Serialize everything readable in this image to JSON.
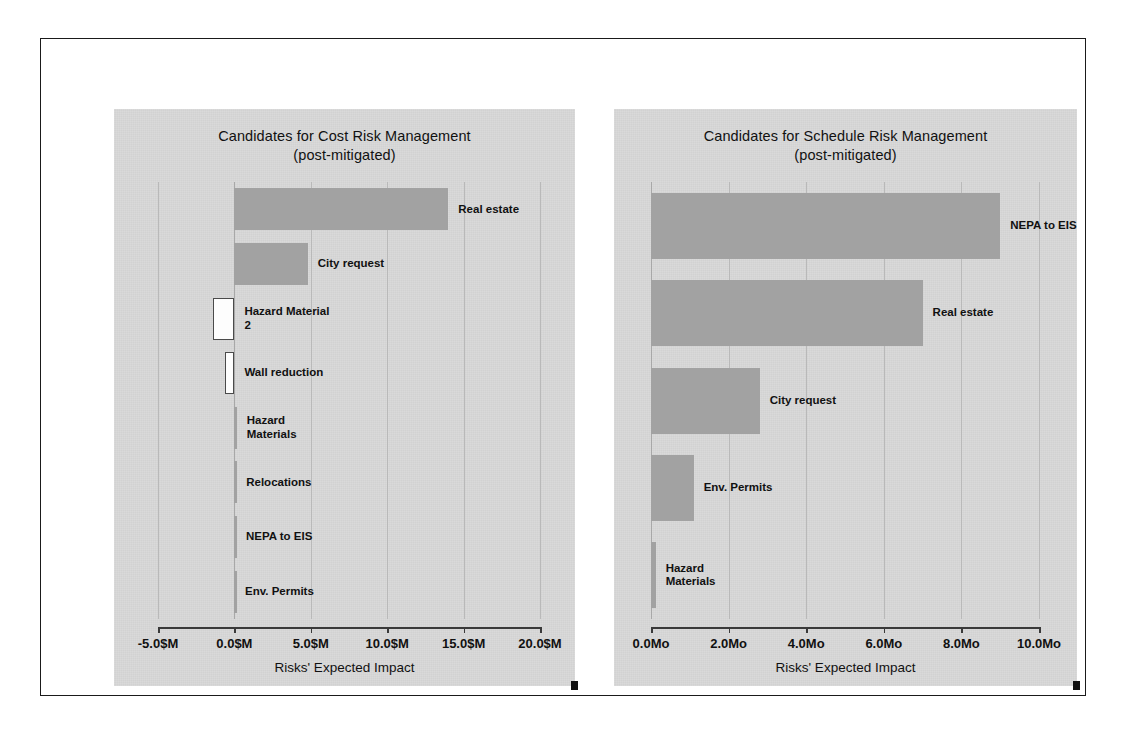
{
  "slide": {
    "border_color": "#1a1a1a",
    "background": "#ffffff"
  },
  "charts": [
    {
      "id": "cost",
      "title_line1": "Candidates for Cost Risk Management",
      "title_line2": "(post-mitigated)",
      "axis_title": "Risks' Expected Impact",
      "panel_color": "#d9d9d9",
      "bar_color": "#a2a2a2",
      "negative_bar_color": "#fdfdfd",
      "ticks": [
        "-5.0$M",
        "0.0$M",
        "5.0$M",
        "10.0$M",
        "15.0$M",
        "20.0$M"
      ],
      "bars": [
        {
          "label": "Real estate",
          "value": 14.0
        },
        {
          "label": "City request",
          "value": 4.8
        },
        {
          "label": "Hazard Material\n2",
          "value": -1.4
        },
        {
          "label": "Wall reduction",
          "value": -0.6
        },
        {
          "label": "Hazard\nMaterials",
          "value": 0.15
        },
        {
          "label": "Relocations",
          "value": 0.12
        },
        {
          "label": "NEPA to EIS",
          "value": 0.1
        },
        {
          "label": "Env. Permits",
          "value": 0.04
        }
      ]
    },
    {
      "id": "schedule",
      "title_line1": "Candidates for Schedule Risk Management",
      "title_line2": "(post-mitigated)",
      "axis_title": "Risks' Expected Impact",
      "panel_color": "#d9d9d9",
      "bar_color": "#a2a2a2",
      "negative_bar_color": "#fdfdfd",
      "ticks": [
        "0.0Mo",
        "2.0Mo",
        "4.0Mo",
        "6.0Mo",
        "8.0Mo",
        "10.0Mo"
      ],
      "bars": [
        {
          "label": "NEPA to EIS",
          "value": 9.0
        },
        {
          "label": "Real estate",
          "value": 7.0
        },
        {
          "label": "City request",
          "value": 2.8
        },
        {
          "label": "Env. Permits",
          "value": 1.1
        },
        {
          "label": "Hazard\nMaterials",
          "value": 0.12
        }
      ]
    }
  ],
  "chart_data": [
    {
      "type": "bar",
      "orientation": "horizontal",
      "title": "Candidates for Cost Risk Management (post-mitigated)",
      "xlabel": "Risks' Expected Impact",
      "ylabel": "",
      "xlim": [
        -5.0,
        20.0
      ],
      "xticks": [
        -5.0,
        0.0,
        5.0,
        10.0,
        15.0,
        20.0
      ],
      "xtick_labels": [
        "-5.0$M",
        "0.0$M",
        "5.0$M",
        "10.0$M",
        "15.0$M",
        "20.0$M"
      ],
      "units": "$M",
      "grid": true,
      "legend": "none",
      "categories": [
        "Real estate",
        "City request",
        "Hazard Material 2",
        "Wall reduction",
        "Hazard Materials",
        "Relocations",
        "NEPA to EIS",
        "Env. Permits"
      ],
      "values": [
        14.0,
        4.8,
        -1.4,
        -0.6,
        0.15,
        0.12,
        0.1,
        0.04
      ]
    },
    {
      "type": "bar",
      "orientation": "horizontal",
      "title": "Candidates for Schedule Risk Management (post-mitigated)",
      "xlabel": "Risks' Expected Impact",
      "ylabel": "",
      "xlim": [
        0.0,
        10.0
      ],
      "xticks": [
        0.0,
        2.0,
        4.0,
        6.0,
        8.0,
        10.0
      ],
      "xtick_labels": [
        "0.0Mo",
        "2.0Mo",
        "4.0Mo",
        "6.0Mo",
        "8.0Mo",
        "10.0Mo"
      ],
      "units": "Months",
      "grid": true,
      "legend": "none",
      "categories": [
        "NEPA to EIS",
        "Real estate",
        "City request",
        "Env. Permits",
        "Hazard Materials"
      ],
      "values": [
        9.0,
        7.0,
        2.8,
        1.1,
        0.12
      ]
    }
  ]
}
